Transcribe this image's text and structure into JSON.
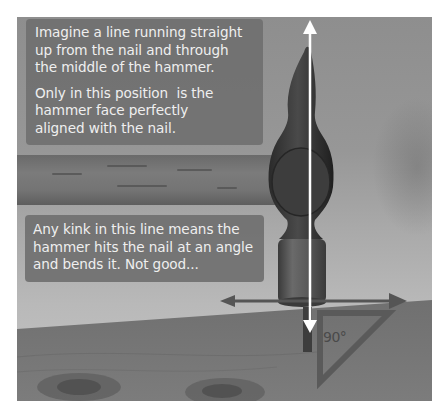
{
  "image": {
    "subject": "Hammer striking a nail on a wooden board with alignment guides",
    "colors": {
      "textbox_bg": "#707070",
      "text": "#efefef",
      "vertical_arrow": "#ffffff",
      "horizontal_arrow": "#555555",
      "triangle": "#5a5a5a"
    }
  },
  "callouts": {
    "top": {
      "paragraph1": [
        "Imagine a line running straight",
        "up from the nail and through",
        "the middle of the hammer."
      ],
      "paragraph2": [
        "Only in this position  is the",
        "hammer face perfectly",
        "aligned with the nail."
      ]
    },
    "bottom": {
      "lines": [
        "Any kink in this line means the",
        "hammer hits the nail at an angle",
        "and bends it. Not good..."
      ]
    }
  },
  "annotations": {
    "angle_label": "90°"
  }
}
